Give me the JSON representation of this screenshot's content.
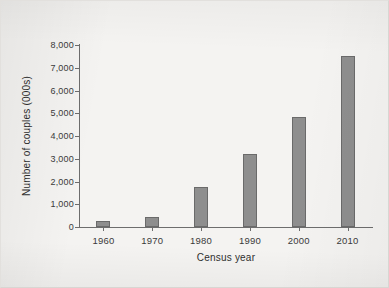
{
  "chart_data": {
    "type": "bar",
    "title": "",
    "subtitle": "",
    "xlabel": "Census year",
    "ylabel": "Number of couples (000s)",
    "categories": [
      "1960",
      "1970",
      "1980",
      "1990",
      "2000",
      "2010"
    ],
    "values": [
      260,
      440,
      1760,
      3210,
      4850,
      7500
    ],
    "series": [
      {
        "name": "Number of couples (000s)",
        "values": [
          260,
          440,
          1760,
          3210,
          4850,
          7500
        ]
      }
    ],
    "ylim": [
      0,
      8000
    ],
    "ytick_values": [
      0,
      1000,
      2000,
      3000,
      4000,
      5000,
      6000,
      7000,
      8000
    ],
    "ytick_labels": [
      "0",
      "1,000",
      "2,000",
      "3,000",
      "4,000",
      "5,000",
      "6,000",
      "7,000",
      "8,000"
    ],
    "xtick_labels": [
      "1960",
      "1970",
      "1980",
      "1990",
      "2000",
      "2010"
    ],
    "grid": false,
    "legend": "none",
    "bar_color": "#8e8e8e",
    "bar_edge_color": "#6a6a6a",
    "axis_color": "#6d6d6d",
    "background_color": "#f4f3f1",
    "text_color": "#2f2f2f"
  }
}
